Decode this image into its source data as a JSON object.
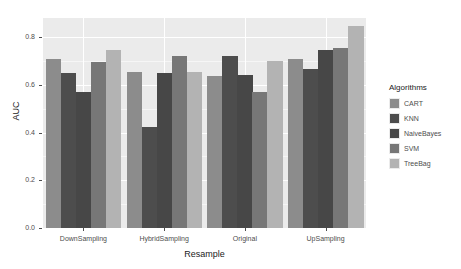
{
  "chart_data": {
    "type": "bar",
    "title": "",
    "subtitle": "",
    "xlabel": "Resample",
    "ylabel": "AUC",
    "categories": [
      "DownSampling",
      "HybridSampling",
      "Original",
      "UpSampling"
    ],
    "series": [
      {
        "name": "CART",
        "color": "#8c8c8c",
        "values": [
          0.71,
          0.655,
          0.635,
          0.71
        ]
      },
      {
        "name": "KNN",
        "color": "#4d4d4d",
        "values": [
          0.648,
          0.425,
          0.72,
          0.665
        ]
      },
      {
        "name": "NaiveBayes",
        "color": "#474747",
        "values": [
          0.572,
          0.65,
          0.642,
          0.745
        ]
      },
      {
        "name": "SVM",
        "color": "#777777",
        "values": [
          0.695,
          0.72,
          0.572,
          0.755
        ]
      },
      {
        "name": "TreeBag",
        "color": "#b3b3b3",
        "values": [
          0.748,
          0.652,
          0.7,
          0.848
        ]
      }
    ],
    "ylim": [
      0.0,
      0.88
    ],
    "yticks": [
      "0.0",
      "0.2",
      "0.4",
      "0.6",
      "0.8"
    ],
    "ytick_values": [
      0.0,
      0.2,
      0.4,
      0.6,
      0.8
    ],
    "grid": true,
    "legend_position": "right",
    "legend_title": "Algorithms",
    "panel_color": "#ebebeb",
    "grid_color": "#ffffff",
    "axis_text_color": "#4d4d4d"
  },
  "legend": {
    "title": "Algorithms",
    "entries": [
      {
        "label": "CART",
        "color": "#8c8c8c"
      },
      {
        "label": "KNN",
        "color": "#4d4d4d"
      },
      {
        "label": "NaiveBayes",
        "color": "#474747"
      },
      {
        "label": "SVM",
        "color": "#777777"
      },
      {
        "label": "TreeBag",
        "color": "#b3b3b3"
      }
    ]
  },
  "axes": {
    "y_title": "AUC",
    "x_title": "Resample",
    "y_tick_labels": [
      "0.0",
      "0.2",
      "0.4",
      "0.6",
      "0.8"
    ],
    "x_tick_labels": [
      "DownSampling",
      "HybridSampling",
      "Original",
      "UpSampling"
    ]
  }
}
